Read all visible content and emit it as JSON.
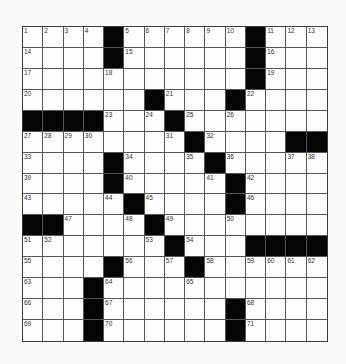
{
  "puzzle": {
    "rows": 15,
    "cols": 15,
    "colors": {
      "block": "#050505",
      "cell": "#fdfdfd",
      "line": "#555555",
      "number": "#333333",
      "background": "#fbfbfa"
    },
    "grid": [
      [
        "1",
        "2",
        "3",
        "4",
        "#",
        "5",
        "6",
        "7",
        "8",
        "9",
        "10",
        "#",
        "11",
        "12",
        "13"
      ],
      [
        "14",
        "",
        "",
        "",
        "#",
        "15",
        "",
        "",
        "",
        "",
        "",
        "#",
        "16",
        "",
        ""
      ],
      [
        "17",
        "",
        "",
        "",
        "18",
        "",
        "",
        "",
        "",
        "",
        "",
        "#",
        "19",
        "",
        ""
      ],
      [
        "20",
        "",
        "",
        "",
        "",
        "",
        "#",
        "21",
        "",
        "",
        "#",
        "22",
        "",
        "",
        ""
      ],
      [
        "#",
        "#",
        "#",
        "#",
        "23",
        "",
        "24",
        "#",
        "25",
        "",
        "26",
        "",
        "",
        "",
        ""
      ],
      [
        "27",
        "28",
        "29",
        "30",
        "",
        "",
        "",
        "31",
        "#",
        "32",
        "",
        "",
        "",
        "#",
        "#"
      ],
      [
        "33",
        "",
        "",
        "",
        "#",
        "34",
        "",
        "",
        "35",
        "#",
        "36",
        "",
        "",
        "37",
        "38"
      ],
      [
        "39",
        "",
        "",
        "",
        "#",
        "40",
        "",
        "",
        "",
        "41",
        "#",
        "42",
        "",
        "",
        ""
      ],
      [
        "43",
        "",
        "",
        "",
        "44",
        "#",
        "45",
        "",
        "",
        "",
        "#",
        "46",
        "",
        "",
        ""
      ],
      [
        "#",
        "#",
        "47",
        "",
        "",
        "48",
        "#",
        "49",
        "",
        "",
        "50",
        "",
        "",
        "",
        ""
      ],
      [
        "51",
        "52",
        "",
        "",
        "",
        "",
        "53",
        "#",
        "54",
        "",
        "",
        "#",
        "#",
        "#",
        "#"
      ],
      [
        "55",
        "",
        "",
        "",
        "#",
        "56",
        "",
        "57",
        "#",
        "58",
        "",
        "59",
        "60",
        "61",
        "62"
      ],
      [
        "63",
        "",
        "",
        "#",
        "64",
        "",
        "",
        "",
        "65",
        "",
        "",
        "",
        "",
        "",
        ""
      ],
      [
        "66",
        "",
        "",
        "#",
        "67",
        "",
        "",
        "",
        "",
        "",
        "#",
        "68",
        "",
        "",
        ""
      ],
      [
        "69",
        "",
        "",
        "#",
        "70",
        "",
        "",
        "",
        "",
        "",
        "#",
        "71",
        "",
        "",
        ""
      ]
    ]
  }
}
